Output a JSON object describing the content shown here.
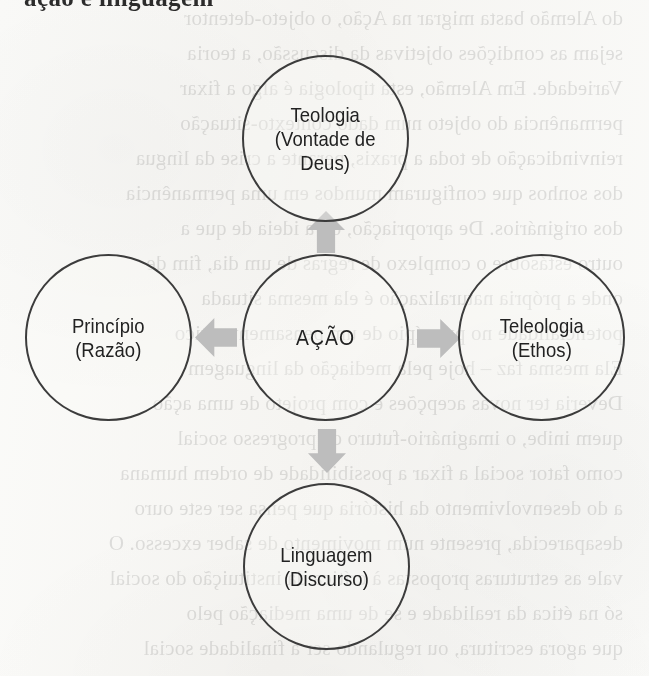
{
  "page": {
    "background_color": "#f8f7f5",
    "cropped_heading_text": "ação e linguagem"
  },
  "diagram": {
    "type": "radial-relationship-diagram",
    "outline_color": "#3c3c3c",
    "arrow_color": "#bdbdbd",
    "text_color": "#222222",
    "center": {
      "id": "acao",
      "label": "AÇÃO",
      "name": "AÇÃO",
      "qualifier": ""
    },
    "nodes": [
      {
        "id": "teologia",
        "position": "top",
        "label": "Teologia\n(Vontade de\nDeus)",
        "name": "Teologia",
        "qualifier": "(Vontade de Deus)"
      },
      {
        "id": "principio",
        "position": "left",
        "label": "Princípio\n(Razão)",
        "name": "Princípio",
        "qualifier": "(Razão)"
      },
      {
        "id": "teleologia",
        "position": "right",
        "label": "Teleologia\n(Ethos)",
        "name": "Teleologia",
        "qualifier": "(Ethos)"
      },
      {
        "id": "linguagem",
        "position": "bottom",
        "label": "Linguagem\n(Discurso)",
        "name": "Linguagem",
        "qualifier": "(Discurso)"
      }
    ],
    "arrows": [
      {
        "id": "arrow-up",
        "from": "acao",
        "to": "teologia",
        "direction": "up"
      },
      {
        "id": "arrow-left",
        "from": "acao",
        "to": "principio",
        "direction": "left"
      },
      {
        "id": "arrow-right",
        "from": "acao",
        "to": "teleologia",
        "direction": "right"
      },
      {
        "id": "arrow-down",
        "from": "acao",
        "to": "linguagem",
        "direction": "down"
      }
    ]
  },
  "bleed_through": {
    "description": "faint mirrored text showing through from the reverse of the scanned page",
    "lines": [
      "do Alemão basta migrar na Ação, o objeto-detentor",
      "sejam as condições objetivas da discussão, a teoria",
      "Variedade. Em Alemão, esta tipologia é algo a fixar",
      "permanência do objeto num dado contexto-situação",
      "reinvindicação de toda a praxis, perante a crise da língua",
      "dos sonhos que configuram mundos em uma permanência",
      "dos originários. De apropriação, ou a ideia de que a",
      "outro estásobre o complexo de regras de um dia, fim de",
      "onde a própria naturalização é ela mesma situada",
      "potencialidade no princípio de um pensamento ético",
      "Ela mesma faz – hoje pela mediação da linguagem",
      "Deveria ter novas acepções e com projeto de uma ação",
      "quem inibe, o imaginário-futuro de progresso social",
      "como fator social a fixar a possibilidade de ordem humana",
      "a do desenvolvimento da história que pensa ser este ouro",
      "desaparecida, presente num movimento de saber excesso. O",
      "vale as estruturas propostas à crítica da instituição do social",
      "só na ética da realidade e se de uma mediação pelo",
      "que agora escritura, ou regulando ser a finalidade social"
    ]
  }
}
